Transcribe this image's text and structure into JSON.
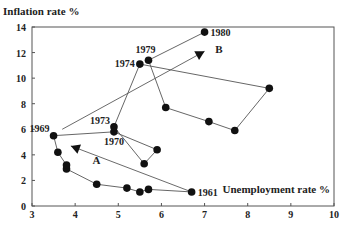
{
  "chart_data": {
    "type": "line",
    "title": "",
    "xlabel": "Unemployment rate %",
    "ylabel": "Inflation rate %",
    "xlim": [
      3,
      10
    ],
    "ylim": [
      0,
      14
    ],
    "xticks": [
      3,
      4,
      5,
      6,
      7,
      8,
      9,
      10
    ],
    "yticks": [
      0,
      2,
      4,
      6,
      8,
      10,
      12,
      14
    ],
    "grid": false,
    "legend": null,
    "series": [
      {
        "name": "Phillips curve path 1961-1980",
        "points": [
          {
            "x": 6.7,
            "y": 1.1,
            "label": "1961"
          },
          {
            "x": 5.7,
            "y": 1.3,
            "label": ""
          },
          {
            "x": 5.5,
            "y": 1.1,
            "label": ""
          },
          {
            "x": 5.2,
            "y": 1.4,
            "label": ""
          },
          {
            "x": 4.5,
            "y": 1.7,
            "label": ""
          },
          {
            "x": 3.8,
            "y": 2.9,
            "label": ""
          },
          {
            "x": 3.8,
            "y": 3.2,
            "label": ""
          },
          {
            "x": 3.6,
            "y": 4.2,
            "label": ""
          },
          {
            "x": 3.5,
            "y": 5.5,
            "label": "1969"
          },
          {
            "x": 4.9,
            "y": 5.8,
            "label": "1970"
          },
          {
            "x": 5.9,
            "y": 4.4,
            "label": ""
          },
          {
            "x": 5.6,
            "y": 3.3,
            "label": ""
          },
          {
            "x": 4.9,
            "y": 6.2,
            "label": "1973"
          },
          {
            "x": 5.5,
            "y": 11.1,
            "label": "1974"
          },
          {
            "x": 8.5,
            "y": 9.2,
            "label": ""
          },
          {
            "x": 7.7,
            "y": 5.9,
            "label": ""
          },
          {
            "x": 7.1,
            "y": 6.6,
            "label": ""
          },
          {
            "x": 6.1,
            "y": 7.7,
            "label": ""
          },
          {
            "x": 5.7,
            "y": 11.4,
            "label": "1979"
          },
          {
            "x": 7.0,
            "y": 13.6,
            "label": "1980"
          }
        ]
      }
    ],
    "annotations": [
      {
        "label": "A",
        "from": {
          "x": 6.7,
          "y": 1.1
        },
        "to": {
          "x": 3.9,
          "y": 4.7
        },
        "text_pos": {
          "x": 4.4,
          "y": 3.6
        }
      },
      {
        "label": "B",
        "from": {
          "x": 3.7,
          "y": 6.0
        },
        "to": {
          "x": 7.0,
          "y": 12.1
        },
        "text_pos": {
          "x": 7.25,
          "y": 12.3
        }
      }
    ]
  },
  "labels": {
    "ylabel": "Inflation rate %",
    "xlabel": "Unemployment rate %",
    "arrow_a": "A",
    "arrow_b": "B"
  }
}
